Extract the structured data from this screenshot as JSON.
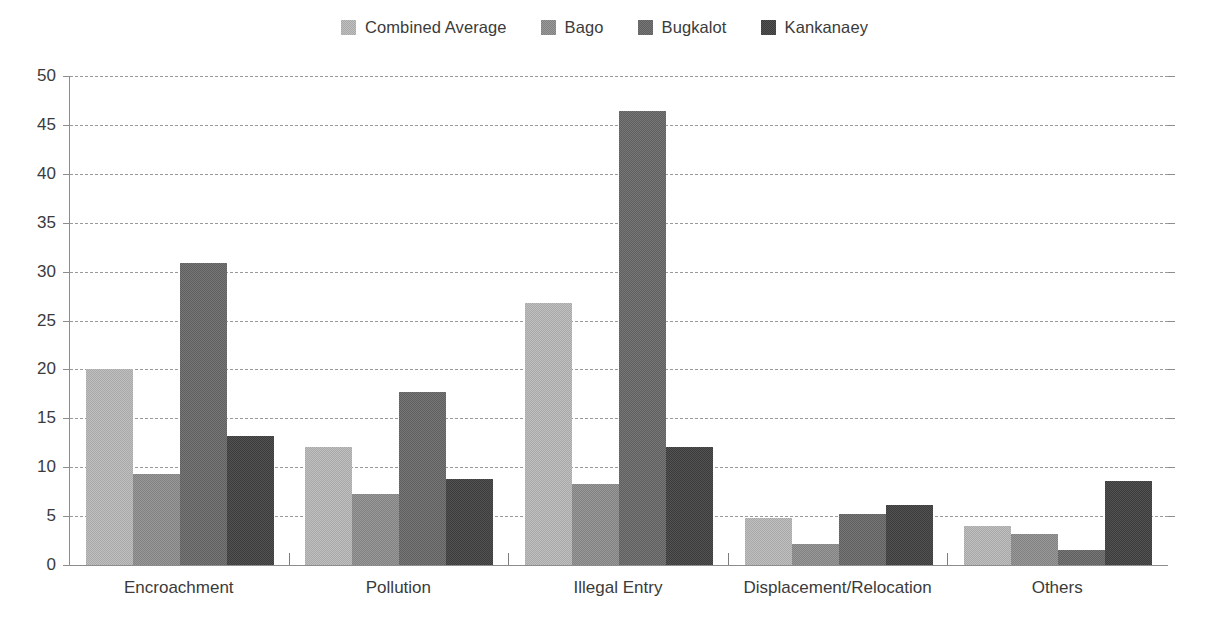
{
  "chart_data": {
    "type": "bar",
    "title": "",
    "subtitle": "",
    "xlabel": "",
    "ylabel": "",
    "ylim": [
      0,
      50
    ],
    "yticks": [
      50,
      45,
      40,
      35,
      30,
      25,
      20,
      15,
      10,
      5,
      0
    ],
    "ytick_labels": [
      "50",
      "45",
      "40",
      "35",
      "30",
      "25",
      "20",
      "15",
      "10",
      "5",
      "0"
    ],
    "grid": true,
    "grid_axis": "y",
    "grid_style": "dashed",
    "legend_position": "top-center",
    "categories": [
      "Encroachment",
      "Pollution",
      "Illegal Entry",
      "Displacement/Relocation",
      "Others"
    ],
    "series": [
      {
        "name": "Combined Average",
        "color": "#b4b4b4",
        "values": [
          20.0,
          12.1,
          26.8,
          4.8,
          4.0
        ]
      },
      {
        "name": "Bago",
        "color": "#8d8d8d",
        "values": [
          9.3,
          7.3,
          8.3,
          2.1,
          3.2
        ]
      },
      {
        "name": "Bugkalot",
        "color": "#6b6b6b",
        "values": [
          30.9,
          17.7,
          46.4,
          5.2,
          1.5
        ]
      },
      {
        "name": "Kankanaey",
        "color": "#474747",
        "values": [
          13.2,
          8.8,
          12.1,
          6.1,
          8.6
        ]
      }
    ],
    "colors": {
      "background": "#ffffff",
      "axis": "#8d8d8d",
      "gridline": "#9a9a9a",
      "text": "#3b3b3b"
    }
  },
  "legend": {
    "items": [
      {
        "label": "Combined Average",
        "swatch_name": "legend-swatch-combined-average"
      },
      {
        "label": "Bago",
        "swatch_name": "legend-swatch-bago"
      },
      {
        "label": "Bugkalot",
        "swatch_name": "legend-swatch-bugkalot"
      },
      {
        "label": "Kankanaey",
        "swatch_name": "legend-swatch-kankanaey"
      }
    ]
  }
}
